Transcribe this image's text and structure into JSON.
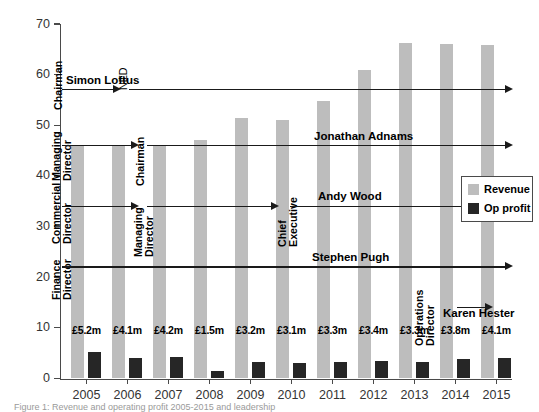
{
  "chart_data": {
    "type": "bar",
    "title": "",
    "xlabel": "",
    "ylabel": "",
    "ylim": [
      0,
      70
    ],
    "ytick_labels": [
      "0",
      "10",
      "20",
      "30",
      "40",
      "50",
      "60",
      "70"
    ],
    "yticks": [
      0,
      10,
      20,
      30,
      40,
      50,
      60,
      70
    ],
    "grid": false,
    "legend_position": "right",
    "categories": [
      "2005",
      "2006",
      "2007",
      "2008",
      "2009",
      "2010",
      "2011",
      "2012",
      "2013",
      "2014",
      "2015"
    ],
    "series": [
      {
        "name": "Revenue",
        "color": "#bdbdbd",
        "values": [
          46.0,
          46.0,
          46.0,
          47.0,
          51.5,
          51.0,
          54.8,
          61.0,
          66.2,
          66.0,
          65.9
        ]
      },
      {
        "name": "Op profit",
        "color": "#262626",
        "values": [
          5.2,
          4.1,
          4.2,
          1.5,
          3.2,
          3.1,
          3.3,
          3.4,
          3.3,
          3.8,
          4.1
        ],
        "data_labels": [
          "£5.2m",
          "£4.1m",
          "£4.2m",
          "£1.5m",
          "£3.2m",
          "£3.1m",
          "£3.3m",
          "£3.4m",
          "£3.3m",
          "£3.8m",
          "£4.1m"
        ]
      }
    ],
    "annotations": {
      "timelines": [
        {
          "person": "Simon Loftus",
          "start_role": "Chairman",
          "start_year": "2005",
          "end_role": "NED",
          "end_year": "2007",
          "level": 57
        },
        {
          "person": "Jonathan Adnams",
          "start_role": "Managing Director",
          "start_year": "2005",
          "end_role": "Chairman",
          "end_year": "2007",
          "level": 46
        },
        {
          "person": "Andy Wood",
          "start_role": "Commercial Director",
          "start_year": "2005",
          "mid_role": "Managing Director",
          "mid_year": "2007",
          "end_role": "Chief Executive",
          "end_year": "2011",
          "level": 34
        },
        {
          "person": "Stephen Pugh",
          "start_role": "Finance Director",
          "start_year": "2005",
          "end_year": "2015",
          "level": 22
        },
        {
          "person": "Karen Hester",
          "start_role": "Operations Director",
          "start_year": "2014",
          "end_year": "2015",
          "level": 14
        }
      ]
    }
  },
  "legend": {
    "items": [
      {
        "label": "Revenue",
        "color": "#bdbdbd"
      },
      {
        "label": "Op profit",
        "color": "#262626"
      }
    ]
  },
  "caption": {
    "text": "Figure 1: Revenue and operating profit 2005-2015 and leadership"
  }
}
